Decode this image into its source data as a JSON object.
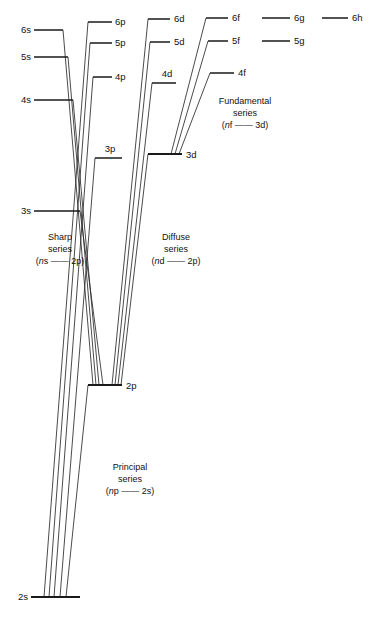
{
  "figure": {
    "type": "energy-level-diagram",
    "name": "Grotrian diagram of alkali spectral series",
    "background_color": "#ffffff",
    "line_color": "#1a1a1a",
    "width": 378,
    "height": 617
  },
  "levels": [
    {
      "id": "6s",
      "label": "6s",
      "column": "s",
      "x1": 34,
      "x2": 63,
      "y": 30,
      "label_x": 31,
      "label_y": 33,
      "label_side": "left"
    },
    {
      "id": "5s",
      "label": "5s",
      "column": "s",
      "x1": 34,
      "x2": 68,
      "y": 57,
      "label_x": 31,
      "label_y": 60,
      "label_side": "left"
    },
    {
      "id": "4s",
      "label": "4s",
      "column": "s",
      "x1": 34,
      "x2": 73,
      "y": 100,
      "label_x": 31,
      "label_y": 103,
      "label_side": "left"
    },
    {
      "id": "3s",
      "label": "3s",
      "column": "s",
      "x1": 34,
      "x2": 80,
      "y": 211,
      "label_x": 31,
      "label_y": 214,
      "label_side": "left"
    },
    {
      "id": "2s",
      "label": "2s",
      "column": "s",
      "x1": 31,
      "x2": 80,
      "y": 597,
      "label_x": 28,
      "label_y": 600,
      "label_side": "left"
    },
    {
      "id": "6p",
      "label": "6p",
      "column": "p",
      "x1": 88,
      "x2": 112,
      "y": 22,
      "label_x": 115,
      "label_y": 25,
      "label_side": "right"
    },
    {
      "id": "5p",
      "label": "5p",
      "column": "p",
      "x1": 90,
      "x2": 112,
      "y": 43,
      "label_x": 115,
      "label_y": 46,
      "label_side": "right"
    },
    {
      "id": "4p",
      "label": "4p",
      "column": "p",
      "x1": 93,
      "x2": 112,
      "y": 77,
      "label_x": 115,
      "label_y": 80,
      "label_side": "right"
    },
    {
      "id": "3p",
      "label": "3p",
      "column": "p",
      "x1": 95,
      "x2": 122,
      "y": 158,
      "label_x": 110,
      "label_y": 152,
      "label_side": "above"
    },
    {
      "id": "2p",
      "label": "2p",
      "column": "p",
      "x1": 88,
      "x2": 122,
      "y": 385,
      "label_x": 126,
      "label_y": 389,
      "label_side": "right"
    },
    {
      "id": "6d",
      "label": "6d",
      "column": "d",
      "x1": 148,
      "x2": 170,
      "y": 19,
      "label_x": 174,
      "label_y": 22,
      "label_side": "right"
    },
    {
      "id": "5d",
      "label": "5d",
      "column": "d",
      "x1": 150,
      "x2": 170,
      "y": 42,
      "label_x": 174,
      "label_y": 45,
      "label_side": "right"
    },
    {
      "id": "4d",
      "label": "4d",
      "column": "d",
      "x1": 152,
      "x2": 176,
      "y": 83,
      "label_x": 167,
      "label_y": 77,
      "label_side": "above"
    },
    {
      "id": "3d",
      "label": "3d",
      "column": "d",
      "x1": 148,
      "x2": 182,
      "y": 154,
      "label_x": 186,
      "label_y": 158,
      "label_side": "right"
    },
    {
      "id": "6f",
      "label": "6f",
      "column": "f",
      "x1": 206,
      "x2": 228,
      "y": 18,
      "label_x": 232,
      "label_y": 21,
      "label_side": "right"
    },
    {
      "id": "5f",
      "label": "5f",
      "column": "f",
      "x1": 208,
      "x2": 228,
      "y": 41,
      "label_x": 232,
      "label_y": 44,
      "label_side": "right"
    },
    {
      "id": "4f",
      "label": "4f",
      "column": "f",
      "x1": 210,
      "x2": 234,
      "y": 73,
      "label_x": 238,
      "label_y": 76,
      "label_side": "right"
    },
    {
      "id": "6g",
      "label": "6g",
      "column": "g",
      "x1": 262,
      "x2": 290,
      "y": 18,
      "label_x": 294,
      "label_y": 21,
      "label_side": "right"
    },
    {
      "id": "5g",
      "label": "5g",
      "column": "g",
      "x1": 262,
      "x2": 290,
      "y": 41,
      "label_x": 294,
      "label_y": 44,
      "label_side": "right"
    },
    {
      "id": "6h",
      "label": "6h",
      "column": "h",
      "x1": 322,
      "x2": 348,
      "y": 18,
      "label_x": 352,
      "label_y": 21,
      "label_side": "right"
    }
  ],
  "transitions": [
    {
      "series": "sharp",
      "from": "6s",
      "to": "2p",
      "x1": 63,
      "y1": 30,
      "x2": 93,
      "y2": 385
    },
    {
      "series": "sharp",
      "from": "5s",
      "to": "2p",
      "x1": 68,
      "y1": 57,
      "x2": 96,
      "y2": 385
    },
    {
      "series": "sharp",
      "from": "4s",
      "to": "2p",
      "x1": 73,
      "y1": 100,
      "x2": 99,
      "y2": 385
    },
    {
      "series": "sharp",
      "from": "3s",
      "to": "2p",
      "x1": 80,
      "y1": 211,
      "x2": 103,
      "y2": 385
    },
    {
      "series": "principal",
      "from": "6p",
      "to": "2s",
      "x1": 88,
      "y1": 22,
      "x2": 44,
      "y2": 597
    },
    {
      "series": "principal",
      "from": "5p",
      "to": "2s",
      "x1": 90,
      "y1": 43,
      "x2": 49,
      "y2": 597
    },
    {
      "series": "principal",
      "from": "4p",
      "to": "2s",
      "x1": 93,
      "y1": 77,
      "x2": 54,
      "y2": 597
    },
    {
      "series": "principal",
      "from": "3p",
      "to": "2s",
      "x1": 95,
      "y1": 158,
      "x2": 60,
      "y2": 597
    },
    {
      "series": "principal",
      "from": "2p",
      "to": "2s",
      "x1": 88,
      "y1": 385,
      "x2": 66,
      "y2": 597
    },
    {
      "series": "diffuse",
      "from": "6d",
      "to": "2p",
      "x1": 148,
      "y1": 19,
      "x2": 112,
      "y2": 385
    },
    {
      "series": "diffuse",
      "from": "5d",
      "to": "2p",
      "x1": 150,
      "y1": 42,
      "x2": 115,
      "y2": 385
    },
    {
      "series": "diffuse",
      "from": "4d",
      "to": "2p",
      "x1": 152,
      "y1": 83,
      "x2": 118,
      "y2": 385
    },
    {
      "series": "diffuse",
      "from": "3d",
      "to": "2p",
      "x1": 148,
      "y1": 154,
      "x2": 121,
      "y2": 385
    },
    {
      "series": "fundamental",
      "from": "6f",
      "to": "3d",
      "x1": 206,
      "y1": 18,
      "x2": 171,
      "y2": 154
    },
    {
      "series": "fundamental",
      "from": "5f",
      "to": "3d",
      "x1": 208,
      "y1": 41,
      "x2": 175,
      "y2": 154
    },
    {
      "series": "fundamental",
      "from": "4f",
      "to": "3d",
      "x1": 210,
      "y1": 73,
      "x2": 179,
      "y2": 154
    }
  ],
  "series_labels": [
    {
      "id": "sharp",
      "x": 60,
      "y": 240,
      "line1": "Sharp",
      "line2": "series",
      "line3_pre": "(",
      "line3_italic": "n",
      "line3_post": "s —— 2p)"
    },
    {
      "id": "diffuse",
      "x": 176,
      "y": 240,
      "line1": "Diffuse",
      "line2": "series",
      "line3_pre": "(",
      "line3_italic": "n",
      "line3_post": "d —— 2p)"
    },
    {
      "id": "fundamental",
      "x": 245,
      "y": 104,
      "line1": "Fundamental",
      "line2": "series",
      "line3_pre": "(",
      "line3_italic": "n",
      "line3_post": "f —— 3d)"
    },
    {
      "id": "principal",
      "x": 130,
      "y": 470,
      "line1": "Principal",
      "line2": "series",
      "line3_pre": "(",
      "line3_italic": "n",
      "line3_post": "p —— 2s)"
    }
  ],
  "chart_data": {
    "type": "diagram",
    "columns": [
      "s",
      "p",
      "d",
      "f",
      "g",
      "h"
    ],
    "series": [
      {
        "name": "Sharp series",
        "notation": "ns — 2p",
        "upper_levels": [
          "6s",
          "5s",
          "4s",
          "3s"
        ],
        "lower_level": "2p"
      },
      {
        "name": "Principal series",
        "notation": "np — 2s",
        "upper_levels": [
          "6p",
          "5p",
          "4p",
          "3p",
          "2p"
        ],
        "lower_level": "2s"
      },
      {
        "name": "Diffuse series",
        "notation": "nd — 2p",
        "upper_levels": [
          "6d",
          "5d",
          "4d",
          "3d"
        ],
        "lower_level": "2p"
      },
      {
        "name": "Fundamental series",
        "notation": "nf — 3d",
        "upper_levels": [
          "6f",
          "5f",
          "4f"
        ],
        "lower_level": "3d"
      }
    ],
    "all_levels": [
      "2s",
      "3s",
      "4s",
      "5s",
      "6s",
      "2p",
      "3p",
      "4p",
      "5p",
      "6p",
      "3d",
      "4d",
      "5d",
      "6d",
      "4f",
      "5f",
      "6f",
      "5g",
      "6g",
      "6h"
    ]
  }
}
